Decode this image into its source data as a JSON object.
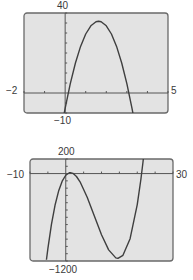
{
  "chart_data": [
    {
      "type": "line",
      "title": "",
      "xlabel": "",
      "ylabel": "",
      "xlim": [
        -2,
        5
      ],
      "ylim": [
        -10,
        40
      ],
      "xscl": 1,
      "yscl": 5,
      "grid": false,
      "window_labels": {
        "xmin": "−2",
        "xmax": "5",
        "ymax": "40",
        "ymin": "−10"
      },
      "series": [
        {
          "name": "f(x)",
          "x": [
            -0.05,
            0,
            0.25,
            0.5,
            0.75,
            1,
            1.25,
            1.5,
            1.625,
            1.75,
            2,
            2.25,
            2.5,
            2.75,
            3,
            3.25,
            3.3
          ],
          "y": [
            -10.4,
            -7.7,
            4.7,
            15.0,
            23.3,
            29.5,
            33.6,
            35.6,
            35.9,
            35.6,
            33.6,
            29.5,
            23.3,
            15.0,
            4.7,
            -7.7,
            -10.4
          ]
        }
      ]
    },
    {
      "type": "line",
      "title": "",
      "xlabel": "",
      "ylabel": "",
      "xlim": [
        -10,
        30
      ],
      "ylim": [
        -1200,
        200
      ],
      "xscl": 5,
      "yscl": 100,
      "grid": false,
      "window_labels": {
        "xmin": "−10",
        "xmax": "30",
        "ymax": "200",
        "ymin": "−1200"
      },
      "series": [
        {
          "name": "g(x)",
          "x": [
            -5.4,
            -5,
            -4,
            -3,
            -2,
            -1,
            0,
            1,
            1.3,
            2,
            3,
            4,
            6,
            8,
            10,
            12,
            14,
            14.6,
            16,
            18,
            20,
            21,
            21.6,
            22
          ],
          "y": [
            -1183,
            -1029,
            -696,
            -435,
            -240,
            -105,
            -23,
            11,
            13,
            3.5,
            -40,
            -113,
            -324,
            -582,
            -839,
            -1047,
            -1157,
            -1164,
            -1122,
            -894,
            -425,
            -85,
            156,
            333
          ]
        }
      ]
    }
  ]
}
